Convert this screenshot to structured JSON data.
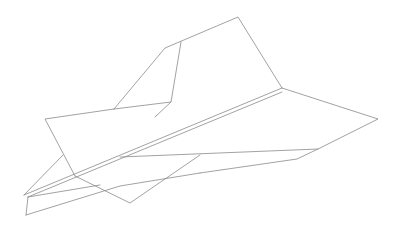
{
  "drawing": {
    "subject": "paper-airplane",
    "style": "line-art",
    "background_color": "#ffffff",
    "stroke_color": "#8a8a8a",
    "width": 402,
    "height": 230,
    "parts": {
      "rear_fin": {
        "points": [
          [
            114,
            109
          ],
          [
            165,
            48
          ],
          [
            238,
            17
          ],
          [
            282,
            88
          ]
        ]
      },
      "fin_inner_fold": {
        "points": [
          [
            181,
            42
          ],
          [
            171,
            102
          ],
          [
            114,
            109
          ]
        ]
      },
      "fin_lower_edge": {
        "points": [
          [
            171,
            102
          ],
          [
            155,
            117
          ]
        ]
      },
      "left_wing": {
        "points": [
          [
            114,
            109
          ],
          [
            45,
            119
          ],
          [
            75,
            176
          ]
        ]
      },
      "left_wing_to_nose_lower": {
        "points": [
          [
            75,
            176
          ],
          [
            130,
            203
          ],
          [
            200,
            155
          ]
        ]
      },
      "left_wing_strut": {
        "points": [
          [
            24,
            195
          ],
          [
            63,
            155
          ]
        ]
      },
      "fuselage_top": {
        "points": [
          [
            24,
            195
          ],
          [
            282,
            88
          ]
        ]
      },
      "fuselage_top_inner": {
        "points": [
          [
            28,
            197
          ],
          [
            282,
            92
          ]
        ]
      },
      "fuselage_bottom": {
        "points": [
          [
            28,
            197
          ],
          [
            26,
            215
          ]
        ]
      },
      "right_wing": {
        "points": [
          [
            282,
            88
          ],
          [
            378,
            119
          ],
          [
            318,
            149
          ],
          [
            120,
            157
          ]
        ]
      },
      "right_wing_lower": {
        "points": [
          [
            318,
            149
          ],
          [
            297,
            159
          ],
          [
            200,
            173
          ]
        ]
      },
      "tail_bottom": {
        "points": [
          [
            26,
            215
          ],
          [
            120,
            186
          ],
          [
            200,
            173
          ]
        ]
      },
      "rear_lines": {
        "points": [
          [
            28,
            197
          ],
          [
            100,
            185
          ]
        ]
      }
    }
  }
}
